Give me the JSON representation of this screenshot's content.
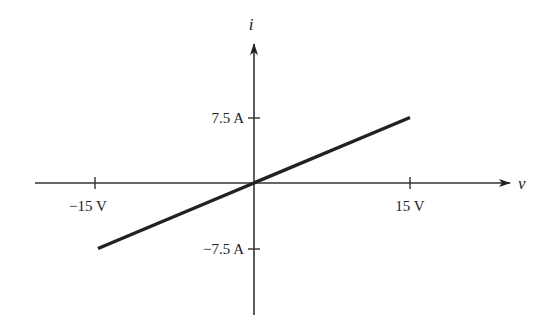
{
  "chart_data": {
    "type": "line",
    "title": "",
    "xlabel": "v",
    "ylabel": "i",
    "x_ticks": [
      {
        "value": -15,
        "label": "−15 V"
      },
      {
        "value": 15,
        "label": "15 V"
      }
    ],
    "y_ticks": [
      {
        "value": 7.5,
        "label": "7.5 A"
      },
      {
        "value": -7.5,
        "label": "−7.5 A"
      }
    ],
    "series": [
      {
        "name": "i-v characteristic",
        "x": [
          -15,
          0,
          15
        ],
        "y": [
          -7.5,
          0,
          7.5
        ]
      }
    ],
    "xlim": [
      -20,
      20
    ],
    "ylim": [
      -16,
      16
    ],
    "grid": false,
    "legend": "none",
    "line_color": "#222222"
  }
}
